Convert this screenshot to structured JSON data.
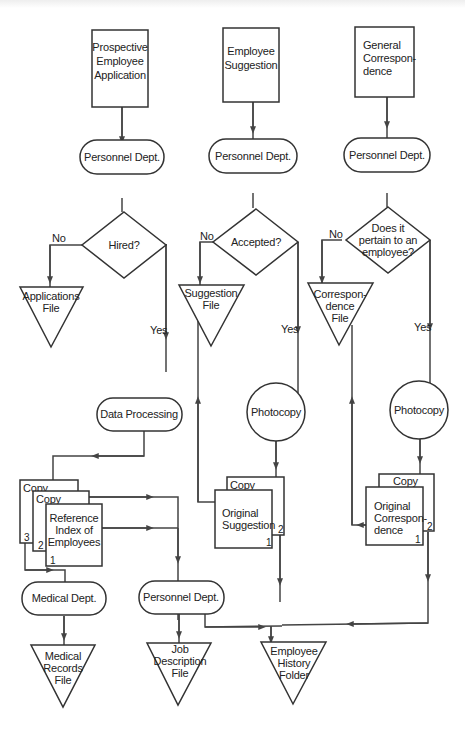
{
  "diagram": {
    "type": "flowchart",
    "title": "",
    "columns": [
      {
        "id": "application",
        "source": {
          "lines": [
            "Prospective",
            "Employee",
            "Application"
          ]
        },
        "process": "Personnel Dept.",
        "decision": {
          "lines": [
            "Hired?"
          ]
        },
        "no_label": "No",
        "yes_label": "Yes",
        "no_storage": {
          "lines": [
            "Applications",
            "File"
          ]
        },
        "yes_process": "Data Processing"
      },
      {
        "id": "suggestion",
        "source": {
          "lines": [
            "Employee",
            "Suggestion"
          ]
        },
        "process": "Personnel Dept.",
        "decision": {
          "lines": [
            "Accepted?"
          ]
        },
        "no_label": "No",
        "yes_label": "Yes",
        "no_storage": {
          "lines": [
            "Suggestion",
            "File"
          ]
        },
        "yes_process": "Photocopy",
        "documents": {
          "copy_label": "Copy",
          "copy_number": "2",
          "original_lines": [
            "Original",
            "Suggestion"
          ],
          "original_number": "1"
        }
      },
      {
        "id": "correspondence",
        "source": {
          "lines": [
            "General",
            "Correspon-",
            "dence"
          ]
        },
        "process": "Personnel Dept.",
        "decision": {
          "lines": [
            "Does it",
            "pertain to an",
            "employee?"
          ]
        },
        "no_label": "No",
        "yes_label": "Yes",
        "no_storage": {
          "lines": [
            "Correspon-",
            "dence",
            "File"
          ]
        },
        "yes_process": "Photocopy",
        "documents": {
          "copy_label": "Copy",
          "copy_number": "2",
          "original_lines": [
            "Original",
            "Correspon-",
            "dence"
          ],
          "original_number": "1"
        }
      }
    ],
    "reference_stack": {
      "copy3_label": "Copy",
      "copy3_number": "3",
      "copy2_label": "Copy",
      "copy2_number": "2",
      "original_lines": [
        "Reference",
        "Index of",
        "Employees"
      ],
      "original_number": "1"
    },
    "bottom": {
      "medical_process": "Medical Dept.",
      "medical_storage": {
        "lines": [
          "Medical",
          "Records",
          "File"
        ]
      },
      "personnel_process": "Personnel Dept.",
      "job_storage": {
        "lines": [
          "Job",
          "Description",
          "File"
        ]
      },
      "history_storage": {
        "lines": [
          "Employee",
          "History",
          "Folder"
        ]
      }
    },
    "colors": {
      "stroke": "#333333",
      "background": "#ffffff",
      "text": "#222222"
    }
  }
}
